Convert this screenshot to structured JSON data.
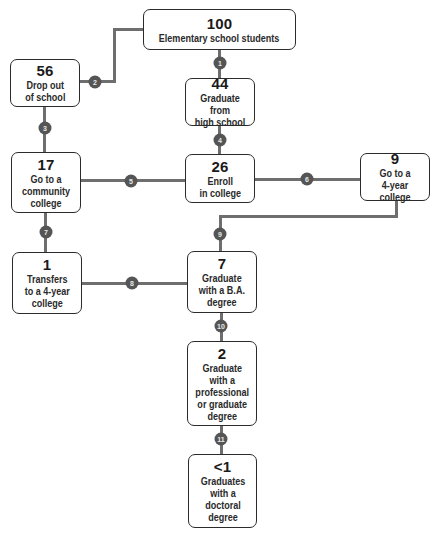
{
  "diagram": {
    "type": "flowchart",
    "nodes": [
      {
        "id": "n100",
        "value": "100",
        "label": "Elementary school students"
      },
      {
        "id": "n56",
        "value": "56",
        "label": "Drop out\nof school"
      },
      {
        "id": "n44",
        "value": "44",
        "label": "Graduate from\nhigh school"
      },
      {
        "id": "n17",
        "value": "17",
        "label": "Go to a\ncommunity\ncollege"
      },
      {
        "id": "n26",
        "value": "26",
        "label": "Enroll\nin college"
      },
      {
        "id": "n9",
        "value": "9",
        "label": "Go to a\n4-year college"
      },
      {
        "id": "n1",
        "value": "1",
        "label": "Transfers\nto a 4-year\ncollege"
      },
      {
        "id": "n7",
        "value": "7",
        "label": "Graduate\nwith a B.A.\ndegree"
      },
      {
        "id": "n2",
        "value": "2",
        "label": "Graduate\nwith a\nprofessional\nor graduate\ndegree"
      },
      {
        "id": "nlt1",
        "value": "<1",
        "label": "Graduates\nwith a\ndoctoral\ndegree"
      }
    ],
    "steps": [
      {
        "n": "1",
        "from": "n100",
        "to": "n44"
      },
      {
        "n": "2",
        "from": "n100",
        "to": "n56"
      },
      {
        "n": "3",
        "from": "n56",
        "to": "n17"
      },
      {
        "n": "4",
        "from": "n44",
        "to": "n26"
      },
      {
        "n": "5",
        "from": "n26",
        "to": "n17"
      },
      {
        "n": "6",
        "from": "n26",
        "to": "n9"
      },
      {
        "n": "7",
        "from": "n17",
        "to": "n1"
      },
      {
        "n": "8",
        "from": "n1",
        "to": "n7"
      },
      {
        "n": "9",
        "from": "n9",
        "to": "n7"
      },
      {
        "n": "10",
        "from": "n7",
        "to": "n2"
      },
      {
        "n": "11",
        "from": "n2",
        "to": "nlt1"
      }
    ]
  },
  "colors": {
    "line": "#6e6e6e",
    "badge": "#555555",
    "border": "#2b2b2b"
  }
}
